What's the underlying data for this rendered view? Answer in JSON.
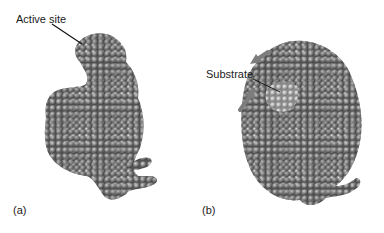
{
  "figure": {
    "panels": [
      {
        "id": "a",
        "tag": "(a)",
        "annotation": "Active site"
      },
      {
        "id": "b",
        "tag": "(b)",
        "annotation": "Substrate"
      }
    ],
    "colors": {
      "protein": "#6b6b6b",
      "protein_highlight": "#b5b5b5",
      "substrate": "#9a9a9a",
      "arrow": "#7d7d7d",
      "leader_line": "#111111",
      "background": "#ffffff"
    }
  }
}
